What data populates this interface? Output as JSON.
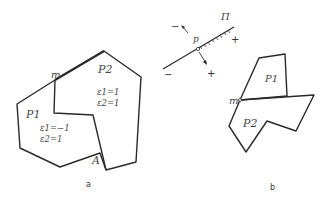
{
  "figure_a": {
    "caption": "a",
    "point_m": "m",
    "point_A": "A",
    "region_P1": {
      "label": "P1",
      "eps1": "ε1=−1",
      "eps2": "ε2=1"
    },
    "region_P2": {
      "label": "P2",
      "eps1": "ε1=1",
      "eps2": "ε2=1"
    }
  },
  "figure_b": {
    "caption": "b",
    "line_label": "Π",
    "point_p": "p",
    "signs": {
      "upper_left": "−",
      "upper_right": "+",
      "lower_left": "−",
      "lower_right": "+"
    },
    "point_m": "m",
    "region_P1": {
      "label": "P1"
    },
    "region_P2": {
      "label": "P2"
    }
  },
  "colors": {
    "stroke": "#2a2a2a",
    "text": "#444444"
  }
}
